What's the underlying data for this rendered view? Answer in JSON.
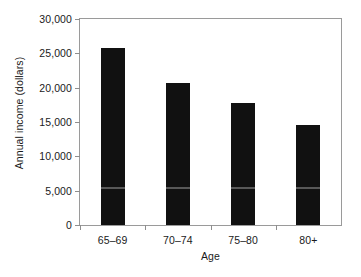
{
  "chart_data": {
    "type": "bar",
    "title": "",
    "xlabel": "Age",
    "ylabel": "Annual income (dollars)",
    "categories": [
      "65–69",
      "70–74",
      "75–80",
      "80+"
    ],
    "values": [
      25800,
      20700,
      17700,
      14500
    ],
    "ylim": [
      0,
      30000
    ],
    "ytick_values": [
      0,
      5000,
      10000,
      15000,
      20000,
      25000,
      30000
    ],
    "ytick_labels": [
      "0",
      "5,000",
      "10,000",
      "15,000",
      "20,000",
      "25,000",
      "30,000"
    ],
    "grid": false,
    "legend": "none",
    "bar_color": "#111111",
    "axis_color": "#9a9a9a",
    "text_color": "#1a1a1a",
    "background": "#ffffff"
  }
}
